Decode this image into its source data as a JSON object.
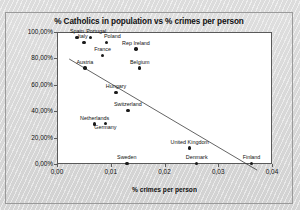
{
  "chart_data": {
    "type": "scatter",
    "title": "% Catholics in population vs % crimes per person",
    "xlabel": "% crimes per person",
    "ylabel": "% Catholics in population",
    "xlim": [
      0,
      0.04
    ],
    "ylim": [
      0,
      1.0
    ],
    "grid": false,
    "legend": "none",
    "xticks": [
      "0,00",
      "0,01",
      "0,02",
      "0,03",
      "0,04"
    ],
    "xtick_values": [
      0,
      0.01,
      0.02,
      0.03,
      0.04
    ],
    "yticks": [
      "0,00%",
      "20,00%",
      "40,00%",
      "60,00%",
      "80,00%",
      "100,00%"
    ],
    "ytick_values": [
      0,
      0.2,
      0.4,
      0.6,
      0.8,
      1.0
    ],
    "point_color": "#1a1a1a",
    "points": [
      {
        "label": "Spain",
        "x": 0.0035,
        "y": 0.965,
        "lx": 0,
        "ly": -7
      },
      {
        "label": "Portugal",
        "x": 0.006,
        "y": 0.965,
        "lx": 6,
        "ly": -7
      },
      {
        "label": "Italy",
        "x": 0.0048,
        "y": 0.93,
        "lx": -1,
        "ly": -6
      },
      {
        "label": "Poland",
        "x": 0.009,
        "y": 0.93,
        "lx": 6,
        "ly": -6
      },
      {
        "label": "Rep Ireland",
        "x": 0.0145,
        "y": 0.88,
        "lx": 0,
        "ly": -6
      },
      {
        "label": "France",
        "x": 0.0083,
        "y": 0.83,
        "lx": 0,
        "ly": -6
      },
      {
        "label": "Belgium",
        "x": 0.0152,
        "y": 0.735,
        "lx": 0,
        "ly": -6
      },
      {
        "label": "Austria",
        "x": 0.005,
        "y": 0.735,
        "lx": 0,
        "ly": -6
      },
      {
        "label": "Hungary",
        "x": 0.0108,
        "y": 0.55,
        "lx": 0,
        "ly": -6
      },
      {
        "label": "Switzerland",
        "x": 0.013,
        "y": 0.415,
        "lx": 0,
        "ly": -6
      },
      {
        "label": "Netherlands",
        "x": 0.0068,
        "y": 0.31,
        "lx": 0,
        "ly": -6
      },
      {
        "label": "Germany",
        "x": 0.0088,
        "y": 0.315,
        "lx": 0,
        "ly": 4
      },
      {
        "label": "United Kingdom",
        "x": 0.0245,
        "y": 0.13,
        "lx": 0,
        "ly": -6
      },
      {
        "label": "Sweden",
        "x": 0.0128,
        "y": 0.012,
        "lx": 0,
        "ly": -6
      },
      {
        "label": "Denmark",
        "x": 0.0258,
        "y": 0.012,
        "lx": 0,
        "ly": -6
      },
      {
        "label": "Finland",
        "x": 0.036,
        "y": 0.012,
        "lx": 0,
        "ly": -6
      }
    ],
    "trendline": {
      "x0": 0.002,
      "y0": 0.8,
      "x1": 0.0375,
      "y1": -0.055
    }
  }
}
